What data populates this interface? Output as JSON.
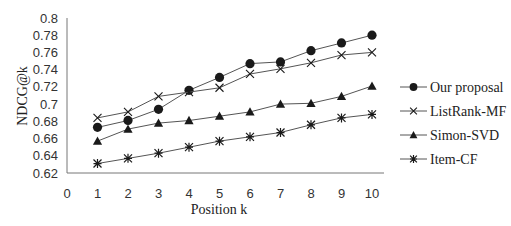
{
  "chart_data": {
    "type": "line",
    "title": "",
    "xlabel": "Position k",
    "ylabel": "NDCG@k",
    "x": [
      1,
      2,
      3,
      4,
      5,
      6,
      7,
      8,
      9,
      10
    ],
    "xticks": [
      "0",
      "1",
      "2",
      "3",
      "4",
      "5",
      "6",
      "7",
      "8",
      "9",
      "10"
    ],
    "xlim": [
      0,
      10
    ],
    "yticks": [
      "0.62",
      "0.64",
      "0.66",
      "0.68",
      "0.7",
      "0.72",
      "0.74",
      "0.76",
      "0.78",
      "0.8"
    ],
    "ylim": [
      0.62,
      0.8
    ],
    "grid": false,
    "legend_position": "right",
    "series": [
      {
        "name": "Our proposal",
        "marker": "circle",
        "values": [
          0.673,
          0.681,
          0.694,
          0.716,
          0.731,
          0.747,
          0.749,
          0.762,
          0.771,
          0.78
        ]
      },
      {
        "name": "ListRank-MF",
        "marker": "x",
        "values": [
          0.684,
          0.691,
          0.709,
          0.714,
          0.719,
          0.735,
          0.741,
          0.748,
          0.757,
          0.76
        ]
      },
      {
        "name": "Simon-SVD",
        "marker": "triangle",
        "values": [
          0.657,
          0.671,
          0.678,
          0.681,
          0.686,
          0.691,
          0.7,
          0.701,
          0.709,
          0.721
        ]
      },
      {
        "name": "Item-CF",
        "marker": "asterisk",
        "values": [
          0.631,
          0.637,
          0.643,
          0.65,
          0.657,
          0.662,
          0.667,
          0.676,
          0.684,
          0.688
        ]
      }
    ]
  },
  "colors": {
    "line": "#555555",
    "marker": "#1a1a1a",
    "axis": "#777777",
    "text": "#333333"
  }
}
